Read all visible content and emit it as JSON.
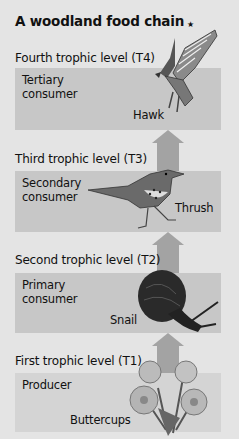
{
  "title": "A woodland food chain",
  "star": "★",
  "colors": {
    "background": "#e4e4e4",
    "box": "#c7c7c7",
    "box_producer": "#d4d4d4",
    "arrow": "#a3a3a3"
  },
  "levels": [
    {
      "label": "Fourth trophic level (T4)",
      "role": "Tertiary consumer",
      "organism": "Hawk",
      "icon": "hawk-icon"
    },
    {
      "label": "Third trophic level (T3)",
      "role": "Secondary consumer",
      "organism": "Thrush",
      "icon": "thrush-icon"
    },
    {
      "label": "Second trophic level (T2)",
      "role": "Primary consumer",
      "organism": "Snail",
      "icon": "snail-icon"
    },
    {
      "label": "First trophic level (T1)",
      "role": "Producer",
      "organism": "Buttercups",
      "icon": "buttercups-icon"
    }
  ]
}
